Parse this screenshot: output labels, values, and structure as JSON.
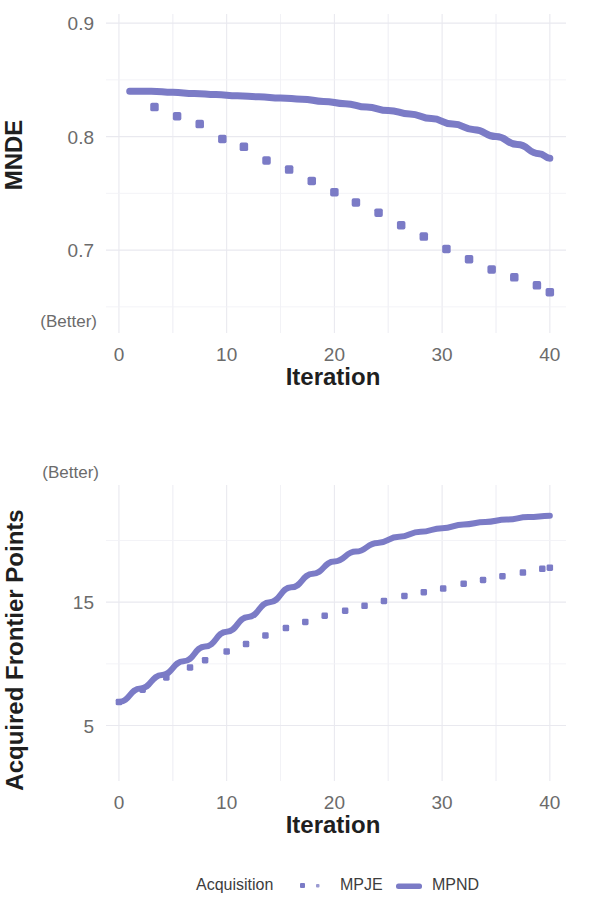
{
  "figure": {
    "background_color": "#ffffff",
    "series_color": "#7b7bc6",
    "grid_color": "#e9e9ef",
    "text_color": "#4d4d4d"
  },
  "legend": {
    "title": "Acquisition",
    "entries": [
      {
        "label": "MPJE",
        "marker": "dotted-square"
      },
      {
        "label": "MPND",
        "marker": "solid-line"
      }
    ]
  },
  "chart_data": [
    {
      "type": "line",
      "panel": "top",
      "title": "",
      "xlabel": "Iteration",
      "ylabel": "MNDE",
      "ylabel_annotation": "(Better)",
      "ylabel_annotation_position": "bottom",
      "xlim": [
        -1.2,
        41.5
      ],
      "ylim": [
        0.627,
        0.908
      ],
      "xticks": [
        0,
        10,
        20,
        30,
        40
      ],
      "xticklabels": [
        "0",
        "10",
        "20",
        "30",
        "40"
      ],
      "yticks": [
        0.7,
        0.8,
        0.9
      ],
      "yticklabels": [
        "0.7",
        "0.8",
        "0.9"
      ],
      "grid": true,
      "legend_position": "bottom",
      "series": [
        {
          "name": "MPND",
          "style": "solid",
          "x": [
            1,
            3,
            5,
            7,
            9,
            11,
            13,
            15,
            17,
            19,
            21,
            23,
            25,
            27,
            29,
            31,
            33,
            35,
            37,
            39,
            40
          ],
          "y": [
            0.84,
            0.84,
            0.839,
            0.838,
            0.837,
            0.836,
            0.835,
            0.834,
            0.833,
            0.831,
            0.829,
            0.826,
            0.823,
            0.82,
            0.816,
            0.811,
            0.806,
            0.8,
            0.793,
            0.785,
            0.781
          ]
        },
        {
          "name": "MPJE",
          "style": "dotted",
          "x": [
            3.3,
            5.4,
            7.5,
            9.6,
            11.6,
            13.7,
            15.8,
            17.9,
            20.0,
            22.0,
            24.1,
            26.2,
            28.3,
            30.4,
            32.5,
            34.6,
            36.7,
            38.8,
            40.0
          ],
          "y": [
            0.826,
            0.818,
            0.811,
            0.798,
            0.791,
            0.779,
            0.771,
            0.761,
            0.751,
            0.742,
            0.733,
            0.722,
            0.712,
            0.701,
            0.692,
            0.683,
            0.676,
            0.669,
            0.663
          ]
        }
      ]
    },
    {
      "type": "line",
      "panel": "bottom",
      "title": "",
      "xlabel": "Iteration",
      "ylabel": "Acquired Frontier Points",
      "ylabel_annotation": "(Better)",
      "ylabel_annotation_position": "top",
      "xlim": [
        -1.2,
        41.5
      ],
      "ylim": [
        0.5,
        24.5
      ],
      "xticks": [
        0,
        10,
        20,
        30,
        40
      ],
      "xticklabels": [
        "0",
        "10",
        "20",
        "30",
        "40"
      ],
      "yticks": [
        5,
        15
      ],
      "yticklabels": [
        "5",
        "15"
      ],
      "grid": true,
      "legend_position": "both",
      "series": [
        {
          "name": "MPND",
          "style": "solid",
          "x": [
            0,
            2,
            4,
            6,
            8,
            10,
            12,
            14,
            16,
            18,
            20,
            22,
            24,
            26,
            28,
            30,
            32,
            34,
            36,
            38,
            40
          ],
          "y": [
            6.9,
            8.0,
            9.1,
            10.2,
            11.4,
            12.6,
            13.8,
            15.0,
            16.2,
            17.3,
            18.3,
            19.1,
            19.8,
            20.3,
            20.7,
            21.0,
            21.3,
            21.5,
            21.7,
            21.9,
            22.0
          ]
        },
        {
          "name": "MPJE",
          "style": "dotted",
          "x": [
            0,
            2.2,
            4.4,
            6.6,
            8.0,
            10.0,
            11.8,
            13.6,
            15.5,
            17.3,
            19.1,
            21.0,
            22.8,
            24.6,
            26.5,
            28.3,
            30.1,
            32.0,
            33.8,
            35.6,
            37.5,
            39.3,
            40.0
          ],
          "y": [
            6.9,
            7.9,
            8.9,
            9.7,
            10.3,
            11.0,
            11.6,
            12.3,
            12.9,
            13.4,
            13.9,
            14.3,
            14.7,
            15.1,
            15.5,
            15.8,
            16.1,
            16.5,
            16.8,
            17.1,
            17.4,
            17.7,
            17.8
          ]
        }
      ]
    }
  ]
}
